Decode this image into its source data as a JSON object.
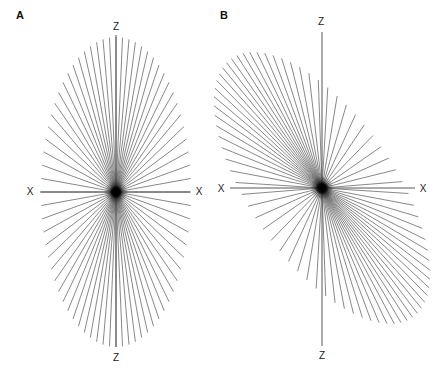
{
  "figure": {
    "width": 438,
    "height": 381,
    "background": "#ffffff",
    "ray_color": "#555555",
    "axis_color": "#444444",
    "center_dot_color": "#000000"
  },
  "panels": [
    {
      "id": "A",
      "label": "A",
      "label_pos": [
        16,
        15
      ],
      "center": [
        116,
        192
      ],
      "description": "Upright ellipse of radiating lines (star burst)",
      "ellipse": {
        "semi_major": 155,
        "semi_minor": 75,
        "rotation_deg": 0
      },
      "ray_count": 72,
      "axes": {
        "z_top": {
          "label": "Z",
          "label_pos": [
            116,
            27
          ],
          "line_end": [
            116,
            35
          ]
        },
        "z_bottom": {
          "label": "Z",
          "label_pos": [
            116,
            358
          ],
          "line_end": [
            116,
            347
          ]
        },
        "x_left": {
          "label": "X",
          "label_pos": [
            30,
            192
          ],
          "line_end": [
            40,
            192
          ]
        },
        "x_right": {
          "label": "X",
          "label_pos": [
            199,
            192
          ],
          "line_end": [
            190,
            192
          ]
        }
      }
    },
    {
      "id": "B",
      "label": "B",
      "label_pos": [
        220,
        15
      ],
      "center": [
        322,
        188
      ],
      "description": "Tilted (sheared) ellipse of radiating lines with straight Z and X axes",
      "ellipse": {
        "semi_major": 158,
        "semi_minor": 72,
        "rotation_deg": 35
      },
      "ray_count": 72,
      "axes": {
        "z_top": {
          "label": "Z",
          "label_pos": [
            321,
            22
          ],
          "line_end": [
            322,
            32
          ]
        },
        "z_bottom": {
          "label": "Z",
          "label_pos": [
            322,
            356
          ],
          "line_end": [
            322,
            346
          ]
        },
        "x_left": {
          "label": "X",
          "label_pos": [
            221,
            189
          ],
          "line_end": [
            230,
            188
          ]
        },
        "x_right": {
          "label": "X",
          "label_pos": [
            423,
            189
          ],
          "line_end": [
            415,
            188
          ]
        }
      }
    }
  ]
}
